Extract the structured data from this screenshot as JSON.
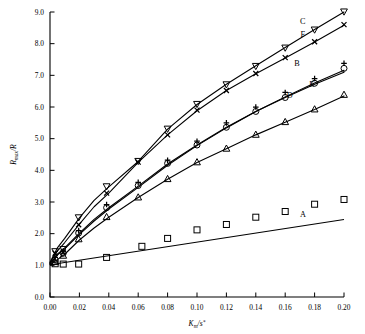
{
  "chart_data": {
    "type": "scatter",
    "title": "",
    "xlabel": "K_m/s*",
    "xlabel_parts": {
      "base": "K",
      "sub": "m",
      "mid": "/s",
      "sup": "*"
    },
    "ylabel": "R_max/R",
    "ylabel_parts": {
      "base": "R",
      "sub": "max",
      "tail": "/R"
    },
    "xlim": [
      0.0,
      0.2
    ],
    "ylim": [
      0.0,
      9.0
    ],
    "xticks": [
      "0.00",
      "0.02",
      "0.04",
      "0.06",
      "0.08",
      "0.10",
      "0.12",
      "0.14",
      "0.16",
      "0.18",
      "0.20"
    ],
    "xtick_values": [
      0.0,
      0.02,
      0.04,
      0.06,
      0.08,
      0.1,
      0.12,
      0.14,
      0.16,
      0.18,
      0.2
    ],
    "yticks": [
      "0.0",
      "1.0",
      "2.0",
      "3.0",
      "4.0",
      "5.0",
      "6.0",
      "7.0",
      "8.0",
      "9.0"
    ],
    "ytick_values": [
      0,
      1,
      2,
      3,
      4,
      5,
      6,
      7,
      8,
      9
    ],
    "grid": false,
    "legend": "inline-curve-labels",
    "series": [
      {
        "name": "A",
        "label": "A",
        "marker": "square",
        "label_x": 0.172,
        "label_y": 2.52,
        "line": [
          [
            0.0,
            1.02
          ],
          [
            0.2,
            2.45
          ]
        ],
        "points": [
          [
            0.0035,
            1.05
          ],
          [
            0.009,
            1.04
          ],
          [
            0.0195,
            1.04
          ],
          [
            0.0385,
            1.25
          ],
          [
            0.0625,
            1.6
          ],
          [
            0.08,
            1.85
          ],
          [
            0.1,
            2.12
          ],
          [
            0.12,
            2.29
          ],
          [
            0.14,
            2.52
          ],
          [
            0.16,
            2.7
          ],
          [
            0.18,
            2.93
          ],
          [
            0.2,
            3.08
          ]
        ]
      },
      {
        "name": "B",
        "label": "B",
        "marker": "circle",
        "marker2": "plus",
        "label_x": 0.168,
        "label_y": 7.28,
        "curve": [
          [
            0.0,
            1.05
          ],
          [
            0.005,
            1.35
          ],
          [
            0.01,
            1.55
          ],
          [
            0.02,
            2.02
          ],
          [
            0.03,
            2.45
          ],
          [
            0.04,
            2.82
          ],
          [
            0.06,
            3.5
          ],
          [
            0.08,
            4.2
          ],
          [
            0.1,
            4.8
          ],
          [
            0.12,
            5.36
          ],
          [
            0.14,
            5.86
          ],
          [
            0.16,
            6.3
          ],
          [
            0.18,
            6.72
          ],
          [
            0.2,
            7.1
          ]
        ],
        "points_circle": [
          [
            0.0035,
            1.18
          ],
          [
            0.009,
            1.38
          ],
          [
            0.0195,
            2.02
          ],
          [
            0.0385,
            2.82
          ],
          [
            0.06,
            3.52
          ],
          [
            0.08,
            4.22
          ],
          [
            0.1,
            4.8
          ],
          [
            0.12,
            5.36
          ],
          [
            0.14,
            5.86
          ],
          [
            0.16,
            6.3
          ],
          [
            0.18,
            6.75
          ],
          [
            0.2,
            7.22
          ]
        ],
        "points_plus": [
          [
            0.0035,
            1.25
          ],
          [
            0.009,
            1.45
          ],
          [
            0.0195,
            2.1
          ],
          [
            0.0385,
            2.92
          ],
          [
            0.06,
            3.62
          ],
          [
            0.08,
            4.32
          ],
          [
            0.1,
            4.92
          ],
          [
            0.12,
            5.5
          ],
          [
            0.14,
            6.0
          ],
          [
            0.16,
            6.46
          ],
          [
            0.18,
            6.9
          ],
          [
            0.2,
            7.38
          ]
        ]
      },
      {
        "name": "C",
        "label": "C",
        "marker": "triangle-down",
        "label_x": 0.172,
        "label_y": 8.62,
        "curve": [
          [
            0.0,
            1.1
          ],
          [
            0.005,
            1.55
          ],
          [
            0.01,
            1.85
          ],
          [
            0.02,
            2.5
          ],
          [
            0.03,
            3.05
          ],
          [
            0.04,
            3.48
          ],
          [
            0.06,
            4.28
          ],
          [
            0.08,
            5.3
          ],
          [
            0.1,
            6.08
          ],
          [
            0.12,
            6.72
          ],
          [
            0.14,
            7.3
          ],
          [
            0.16,
            7.88
          ],
          [
            0.18,
            8.45
          ],
          [
            0.2,
            9.0
          ]
        ],
        "points": [
          [
            0.0035,
            1.45
          ],
          [
            0.009,
            1.52
          ],
          [
            0.0195,
            2.52
          ],
          [
            0.0385,
            3.5
          ],
          [
            0.06,
            4.3
          ],
          [
            0.08,
            5.32
          ],
          [
            0.1,
            6.1
          ],
          [
            0.12,
            6.72
          ],
          [
            0.14,
            7.3
          ],
          [
            0.16,
            7.88
          ],
          [
            0.18,
            8.45
          ],
          [
            0.2,
            9.02
          ]
        ]
      },
      {
        "name": "D",
        "label": "D",
        "marker": "triangle-up",
        "label_x": 0.163,
        "label_y": 6.3,
        "curve": [
          [
            0.0,
            1.02
          ],
          [
            0.005,
            1.18
          ],
          [
            0.01,
            1.35
          ],
          [
            0.02,
            1.8
          ],
          [
            0.03,
            2.18
          ],
          [
            0.04,
            2.52
          ],
          [
            0.06,
            3.14
          ],
          [
            0.08,
            3.72
          ],
          [
            0.1,
            4.25
          ],
          [
            0.12,
            4.68
          ],
          [
            0.14,
            5.12
          ],
          [
            0.16,
            5.52
          ],
          [
            0.18,
            5.92
          ],
          [
            0.2,
            6.35
          ]
        ],
        "points": [
          [
            0.0035,
            1.1
          ],
          [
            0.009,
            1.3
          ],
          [
            0.0195,
            1.82
          ],
          [
            0.0385,
            2.52
          ],
          [
            0.06,
            3.14
          ],
          [
            0.08,
            3.72
          ],
          [
            0.1,
            4.25
          ],
          [
            0.12,
            4.68
          ],
          [
            0.14,
            5.12
          ],
          [
            0.16,
            5.52
          ],
          [
            0.18,
            5.92
          ],
          [
            0.2,
            6.38
          ]
        ]
      },
      {
        "name": "E",
        "label": "E",
        "marker": "none",
        "label_x": 0.178,
        "label_y": 6.62,
        "curve": [
          [
            0.0,
            1.05
          ],
          [
            0.005,
            1.32
          ],
          [
            0.01,
            1.52
          ],
          [
            0.02,
            1.98
          ],
          [
            0.03,
            2.4
          ],
          [
            0.04,
            2.78
          ],
          [
            0.06,
            3.46
          ],
          [
            0.08,
            4.16
          ],
          [
            0.1,
            4.78
          ],
          [
            0.12,
            5.34
          ],
          [
            0.14,
            5.86
          ],
          [
            0.16,
            6.32
          ],
          [
            0.18,
            6.76
          ],
          [
            0.2,
            7.16
          ]
        ]
      },
      {
        "name": "F",
        "label": "F",
        "marker": "cross",
        "label_x": 0.172,
        "label_y": 8.2,
        "curve": [
          [
            0.0,
            1.08
          ],
          [
            0.005,
            1.45
          ],
          [
            0.01,
            1.72
          ],
          [
            0.02,
            2.3
          ],
          [
            0.03,
            2.85
          ],
          [
            0.04,
            3.28
          ],
          [
            0.06,
            4.25
          ],
          [
            0.08,
            5.12
          ],
          [
            0.1,
            5.88
          ],
          [
            0.12,
            6.52
          ],
          [
            0.14,
            7.05
          ],
          [
            0.16,
            7.55
          ],
          [
            0.18,
            8.05
          ],
          [
            0.2,
            8.58
          ]
        ],
        "points": [
          [
            0.0035,
            1.38
          ],
          [
            0.009,
            1.42
          ],
          [
            0.0195,
            2.28
          ],
          [
            0.0385,
            3.28
          ],
          [
            0.06,
            4.26
          ],
          [
            0.08,
            5.12
          ],
          [
            0.1,
            5.9
          ],
          [
            0.12,
            6.52
          ],
          [
            0.14,
            7.06
          ],
          [
            0.16,
            7.56
          ],
          [
            0.18,
            8.06
          ],
          [
            0.2,
            8.6
          ]
        ]
      }
    ]
  }
}
